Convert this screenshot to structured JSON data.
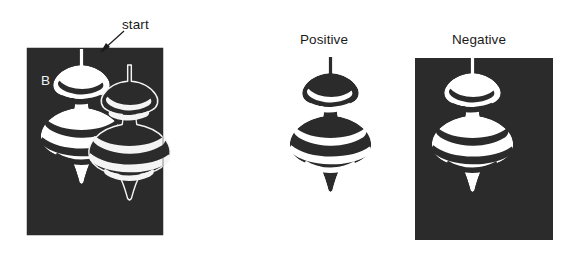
{
  "figure": {
    "panel_letter": "B",
    "background_color": "#ffffff",
    "panel_fill_color": "#2b2b2b",
    "shape_dark_color": "#2b2b2b",
    "shape_light_color": "#ffffff",
    "outline_color": "#2b2b2b",
    "shape_name": "spinning-top-vase-silhouette"
  },
  "annotations": {
    "start_label": "start",
    "start_arrow": "arrow-pointing-down-left-to-stem-top"
  },
  "panels": [
    {
      "id": "panel-b",
      "letter": "B",
      "label": "B",
      "type": "composite-overlapping",
      "background": "dark",
      "description": "dark panel containing a white negative vase shape overlapped by a dark positive vase shape"
    },
    {
      "id": "panel-positive",
      "label": "Positive",
      "type": "positive",
      "background": "white",
      "description": "dark vase silhouette on white background"
    },
    {
      "id": "panel-negative",
      "label": "Negative",
      "type": "negative",
      "background": "dark",
      "description": "white vase silhouette on dark background"
    }
  ]
}
